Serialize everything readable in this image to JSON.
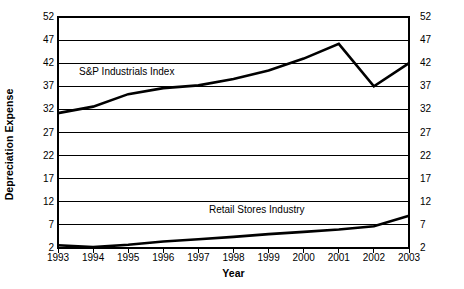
{
  "chart_data": {
    "type": "line",
    "title": "",
    "xlabel": "Year",
    "ylabel": "Depreciation Expense",
    "x": [
      1993,
      1994,
      1995,
      1996,
      1997,
      1998,
      1999,
      2000,
      2001,
      2002,
      2003
    ],
    "xtick_labels": [
      "1993",
      "1994",
      "1995",
      "1996",
      "1997",
      "1998",
      "1999",
      "2000",
      "2001",
      "2002",
      "2003"
    ],
    "ytick_labels": [
      "2",
      "7",
      "12",
      "17",
      "22",
      "27",
      "32",
      "37",
      "42",
      "47",
      "52"
    ],
    "yticks": [
      2,
      7,
      12,
      17,
      22,
      27,
      32,
      37,
      42,
      47,
      52
    ],
    "ylim": [
      2,
      52
    ],
    "xlim": [
      1993,
      2003
    ],
    "grid": true,
    "grid_axis": "y",
    "legend": "inline-annotations",
    "right_axis_labels": true,
    "series": [
      {
        "name": "S&P Industrials Index",
        "color": "#000000",
        "values": [
          31.2,
          32.6,
          35.3,
          36.6,
          37.2,
          38.6,
          40.4,
          43.0,
          46.2,
          37.0,
          42.0
        ]
      },
      {
        "name": "Retail Stores Industry",
        "color": "#000000",
        "values": [
          2.6,
          2.2,
          2.7,
          3.4,
          3.9,
          4.4,
          5.0,
          5.5,
          6.0,
          6.7,
          9.0
        ]
      }
    ],
    "annotations": [
      {
        "text": "S&P Industrials Index",
        "x": 1994.4,
        "y": 39.5
      },
      {
        "text": "Retail Stores Industry",
        "x": 1998.3,
        "y": 9.0
      }
    ]
  }
}
